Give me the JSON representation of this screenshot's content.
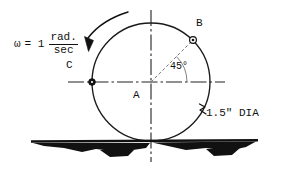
{
  "diagram": {
    "annotations": {
      "omega_symbol": "ω",
      "omega_equals": "= 1",
      "omega_numerator": "rad.",
      "omega_denominator": "sec",
      "omega_full": "ω = 1 rad./sec",
      "label_center": "A",
      "label_point_b": "B",
      "label_point_c": "C",
      "angle_label": "45°",
      "diameter_label": "1.5\" DIA"
    },
    "geometry": {
      "circle_center_x": 151,
      "circle_center_y": 82,
      "circle_radius": 59,
      "point_b_x": 193,
      "point_b_y": 40,
      "point_b_angle_deg": 45,
      "point_c_x": 92,
      "point_c_y": 82,
      "point_c_angle_deg": 180,
      "ground_line_y": 141,
      "ground_line_x1": 31,
      "ground_line_x2": 258,
      "rotation_direction": "counterclockwise"
    },
    "colors": {
      "ink": "#111111",
      "paper": "#ffffff",
      "thin_line": "#555555"
    }
  }
}
